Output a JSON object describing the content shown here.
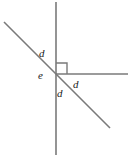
{
  "figure": {
    "kind": "geometry-angle-diagram",
    "width": 137,
    "height": 161,
    "background_color": "#ffffff",
    "line_color": "#7a7a7a",
    "label_color": "#1a1a1a",
    "vertex": {
      "x": 56,
      "y": 74
    },
    "lines": [
      {
        "name": "vertical-line",
        "x1": 56,
        "y1": 2,
        "x2": 56,
        "y2": 155
      },
      {
        "name": "diagonal-line",
        "x1": 4,
        "y1": 22,
        "x2": 110,
        "y2": 128
      },
      {
        "name": "horizontal-ray",
        "x1": 56,
        "y1": 74,
        "x2": 128,
        "y2": 74
      }
    ],
    "right_angle_marker": {
      "name": "right-angle-square",
      "x": 56,
      "y": 63,
      "size": 11,
      "corner": "upper-right-quadrant"
    },
    "labels": [
      {
        "name": "angle-label-d-upper-left",
        "text": "d",
        "x": 39,
        "y": 48
      },
      {
        "name": "angle-label-e-vertex",
        "text": "e",
        "x": 38,
        "y": 70
      },
      {
        "name": "angle-label-d-right",
        "text": "d",
        "x": 73,
        "y": 79
      },
      {
        "name": "angle-label-d-lower",
        "text": "d",
        "x": 57,
        "y": 88
      }
    ]
  }
}
